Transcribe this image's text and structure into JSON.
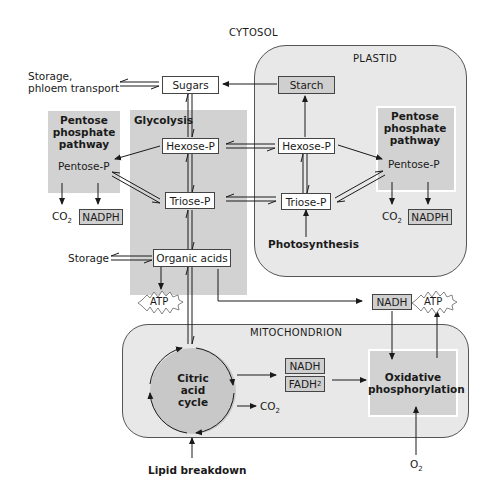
{
  "compartments": {
    "cytosol": "CYTOSOL",
    "plastid": "PLASTID",
    "mitochondrion": "MITOCHONDRION"
  },
  "pathways": {
    "glycolysis": "Glycolysis",
    "ppp_cytosol": [
      "Pentose",
      "phosphate",
      "pathway"
    ],
    "ppp_plastid": [
      "Pentose",
      "phosphate",
      "pathway"
    ],
    "citric_acid_cycle": [
      "Citric",
      "acid",
      "cycle"
    ],
    "oxidative_phosphorylation": [
      "Oxidative",
      "phosphorylation"
    ]
  },
  "nodes": {
    "sugars": "Sugars",
    "starch": "Starch",
    "hexose_p_cytosol": "Hexose-P",
    "triose_p_cytosol": "Triose-P",
    "organic_acids": "Organic acids",
    "hexose_p_plastid": "Hexose-P",
    "triose_p_plastid": "Triose-P",
    "pentose_p_cytosol": "Pentose-P",
    "pentose_p_plastid": "Pentose-P",
    "nadph_cytosol": "NADPH",
    "nadph_plastid": "NADPH",
    "nadh_cytosol": "NADH",
    "nadh_mito": "NADH",
    "fadh2_mito": "FADH",
    "atp_glycolysis": "ATP",
    "atp_oxphos": "ATP"
  },
  "labels": {
    "storage_phloem": [
      "Storage,",
      "phloem transport"
    ],
    "storage": "Storage",
    "photosynthesis": "Photosynthesis",
    "lipid_breakdown": "Lipid breakdown",
    "co2": "CO",
    "o2": "O",
    "sub2": "2"
  },
  "colors": {
    "region_fill": "#e8e8e8",
    "pathway_fill": "#d2d2d2",
    "node_fill": "#ffffff",
    "node_gray": "#cfcfcf",
    "line": "#1a1a1a"
  }
}
